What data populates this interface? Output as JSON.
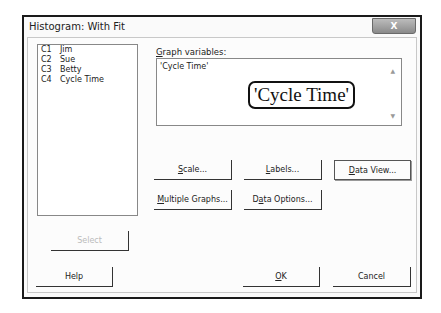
{
  "window": {
    "title": "Histogram: With Fit",
    "close_glyph": "X"
  },
  "columns_list": {
    "items": [
      {
        "id": "C1",
        "name": "Jim"
      },
      {
        "id": "C2",
        "name": "Sue"
      },
      {
        "id": "C3",
        "name": "Betty"
      },
      {
        "id": "C4",
        "name": "Cycle Time"
      }
    ]
  },
  "graph_variables": {
    "label": "Graph variables:",
    "label_mnemonic": "G",
    "value": "'Cycle Time'",
    "callout": "'Cycle Time'"
  },
  "buttons": {
    "scale": "Scale...",
    "labels": "Labels...",
    "data_view": "Data View...",
    "multiple_graphs": "Multiple Graphs...",
    "data_options": "Data Options...",
    "select": "Select",
    "help": "Help",
    "ok": "OK",
    "cancel": "Cancel"
  }
}
